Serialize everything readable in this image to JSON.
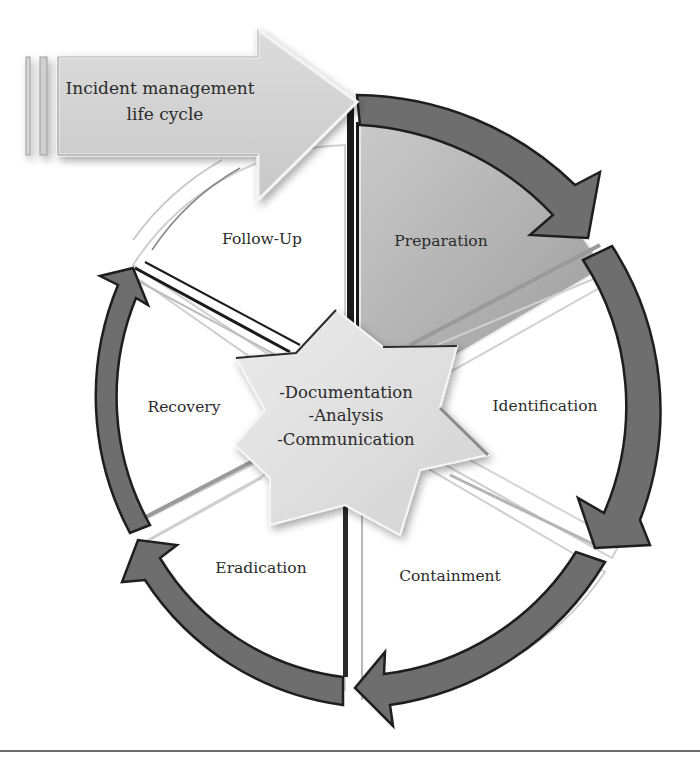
{
  "diagram": {
    "title": {
      "line1": "Incident management",
      "line2": "life cycle"
    },
    "phases": [
      {
        "id": "preparation",
        "label": "Preparation",
        "highlighted": true
      },
      {
        "id": "identification",
        "label": "Identification",
        "highlighted": false
      },
      {
        "id": "containment",
        "label": "Containment",
        "highlighted": false
      },
      {
        "id": "eradication",
        "label": "Eradication",
        "highlighted": false
      },
      {
        "id": "recovery",
        "label": "Recovery",
        "highlighted": false
      },
      {
        "id": "follow-up",
        "label": "Follow-Up",
        "highlighted": false
      }
    ],
    "center": {
      "lines": [
        "-Documentation",
        "-Analysis",
        "-Communication"
      ]
    },
    "colors": {
      "arrow_fill": "#6e6e6e",
      "arrow_stroke": "#1e1e1e",
      "highlight_sector": "#a9a9a9",
      "title_arrow": "#d2d2d2",
      "star_fill": "#e1e1e1",
      "text": "#2b2b2b",
      "rule": "#6a6a6a"
    }
  }
}
